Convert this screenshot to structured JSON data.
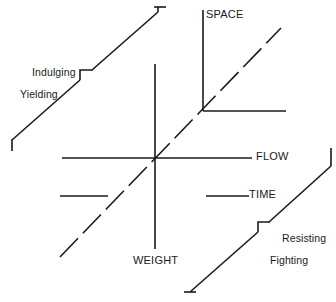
{
  "figure": {
    "type": "line-diagram",
    "title": "",
    "background_color": "#ffffff",
    "stroke_color": "#1a1a1a"
  },
  "axes": [
    {
      "id": "space",
      "label": "SPACE",
      "kind": "corner-axis",
      "description": "vertical stroke rising from corner plus horizontal stroke running right",
      "corner": {
        "x": 203,
        "y": 111
      },
      "vertical_end": {
        "x": 203,
        "y": 10
      },
      "horizontal_end": {
        "x": 286,
        "y": 111
      }
    },
    {
      "id": "flow",
      "label": "FLOW",
      "kind": "horizontal-axis",
      "start": {
        "x": 62,
        "y": 158
      },
      "end": {
        "x": 252,
        "y": 158
      }
    },
    {
      "id": "weight",
      "label": "WEIGHT",
      "kind": "vertical-axis",
      "start": {
        "x": 155,
        "y": 64
      },
      "end": {
        "x": 155,
        "y": 249
      }
    },
    {
      "id": "time",
      "label": "TIME",
      "kind": "dashed-diagonal-axis",
      "description": "dashed diagonal rising left-to-right through the centre, with two solid horizontal pointer segments",
      "diagonal_start": {
        "x": 60,
        "y": 257
      },
      "diagonal_end": {
        "x": 281,
        "y": 28
      },
      "pointer_left": {
        "x1": 60,
        "y1": 196,
        "x2": 108,
        "y2": 196
      },
      "pointer_right": {
        "x1": 206,
        "y1": 196,
        "x2": 249,
        "y2": 196
      }
    }
  ],
  "zones": [
    {
      "id": "indulging",
      "line1": "Indulging",
      "line2": "Yielding",
      "bracket": "upper-left long diagonal with step notch",
      "diagonal_start": {
        "x": 12,
        "y": 151
      },
      "diagonal_end": {
        "x": 158,
        "y": 6
      },
      "notch": {
        "x": 80,
        "y": 80
      }
    },
    {
      "id": "resisting",
      "line1": "Resisting",
      "line2": "Fighting",
      "bracket": "lower-right long diagonal with step notch",
      "diagonal_start": {
        "x": 186,
        "y": 292
      },
      "diagonal_end": {
        "x": 330,
        "y": 148
      },
      "notch": {
        "x": 258,
        "y": 229
      }
    }
  ],
  "labels": {
    "space": "SPACE",
    "flow": "FLOW",
    "time": "TIME",
    "weight": "WEIGHT",
    "indulging_1": "Indulging",
    "indulging_2": "Yielding",
    "resisting_1": "Resisting",
    "resisting_2": "Fighting"
  }
}
